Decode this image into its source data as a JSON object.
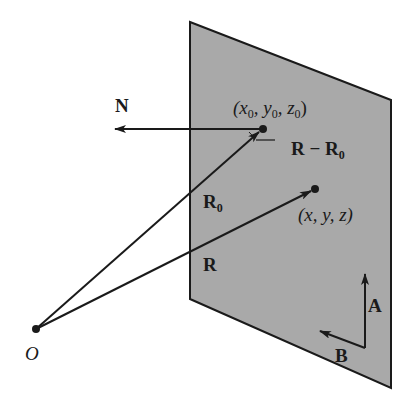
{
  "diagram": {
    "colors": {
      "plane_fill": "#a9a9a9",
      "stroke": "#1a1a1a",
      "background": "#ffffff"
    },
    "labels": {
      "normal": "N",
      "point0_open": "(x",
      "point0_sub1": "0",
      "point0_mid1": ", y",
      "point0_sub2": "0",
      "point0_mid2": ", z",
      "point0_sub3": "0",
      "point0_close": ")",
      "diff_R": "R",
      "diff_minus": " − R",
      "diff_sub": "0",
      "point": "(x, y, z)",
      "R0_main": "R",
      "R0_sub": "0",
      "R": "R",
      "origin": "O",
      "A": "A",
      "B": "B"
    }
  }
}
